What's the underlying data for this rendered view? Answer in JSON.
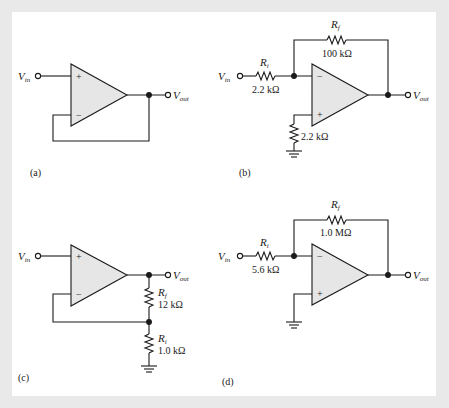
{
  "figure": {
    "background_color": "#e9e9e9",
    "panel_color": "#ffffff",
    "opamp_fill": "#e6e6e6",
    "line_color": "#1a1a1a"
  },
  "circuits": [
    {
      "id": "a",
      "caption": "(a)",
      "input_label": "V",
      "input_sub": "in",
      "output_label": "V",
      "output_sub": "out",
      "plus": "+",
      "minus": "−"
    },
    {
      "id": "b",
      "caption": "(b)",
      "input_label": "V",
      "input_sub": "in",
      "output_label": "V",
      "output_sub": "out",
      "plus": "+",
      "minus": "−",
      "rf_label": "R",
      "rf_sub": "f",
      "rf_value": "100 kΩ",
      "ri_label": "R",
      "ri_sub": "i",
      "ri_value": "2.2 kΩ",
      "rcomp_value": "2.2 kΩ"
    },
    {
      "id": "c",
      "caption": "(c)",
      "input_label": "V",
      "input_sub": "in",
      "output_label": "V",
      "output_sub": "out",
      "plus": "+",
      "minus": "−",
      "rf_label": "R",
      "rf_sub": "f",
      "rf_value": "12 kΩ",
      "ri_label": "R",
      "ri_sub": "i",
      "ri_value": "1.0 kΩ"
    },
    {
      "id": "d",
      "caption": "(d)",
      "input_label": "V",
      "input_sub": "in",
      "output_label": "V",
      "output_sub": "out",
      "plus": "+",
      "minus": "−",
      "rf_label": "R",
      "rf_sub": "f",
      "rf_value": "1.0 MΩ",
      "ri_label": "R",
      "ri_sub": "i",
      "ri_value": "5.6 kΩ"
    }
  ]
}
